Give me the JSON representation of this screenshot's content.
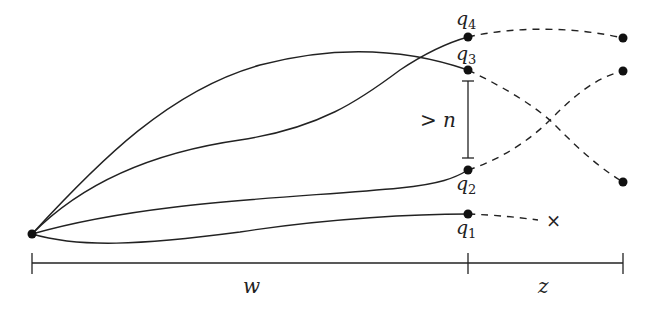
{
  "diagram": {
    "labels": {
      "q4": "q",
      "q4_sub": "4",
      "q3": "q",
      "q3_sub": "3",
      "q2": "q",
      "q2_sub": "2",
      "q1": "q",
      "q1_sub": "1",
      "gap": "> n",
      "w": "w",
      "z": "z",
      "dead_end": "×"
    },
    "nodes": {
      "origin": [
        32,
        234
      ],
      "q4": [
        468,
        37
      ],
      "q3": [
        468,
        70
      ],
      "q2": [
        468,
        170
      ],
      "q1": [
        468,
        214
      ],
      "r_top": [
        623,
        38
      ],
      "r_mid": [
        623,
        71
      ],
      "r_low": [
        623,
        182
      ]
    },
    "colors": {
      "ink": "#222222"
    }
  }
}
